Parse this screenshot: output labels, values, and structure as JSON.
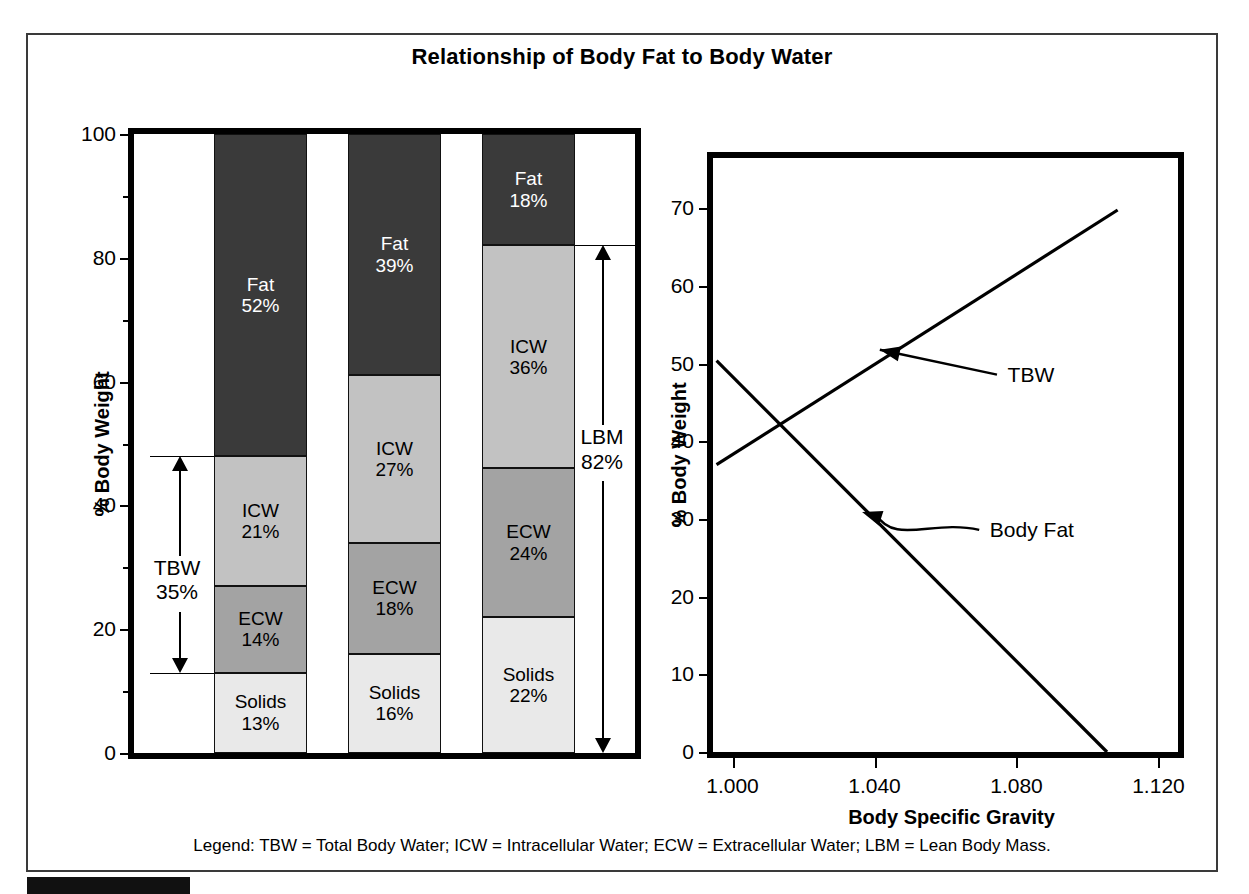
{
  "figure": {
    "title": "Relationship of Body Fat to Body Water",
    "legend": "Legend:  TBW = Total Body Water; ICW = Intracellular Water; ECW = Extracellular Water; LBM = Lean Body Mass."
  },
  "colors": {
    "fat": "#3a3a3a",
    "icw": "#c2c2c2",
    "ecw": "#a3a3a3",
    "solids": "#e9e9e9",
    "frame": "#000000",
    "text": "#000000",
    "background": "#ffffff"
  },
  "chart_data": [
    {
      "type": "bar",
      "id": "left-stacked-bar",
      "title": "",
      "xlabel": "",
      "ylabel": "% Body Weight",
      "ylim": [
        0,
        100
      ],
      "stacked": true,
      "grid": false,
      "legend_position": "in-segment-labels",
      "ytick_labels": [
        "0",
        "20",
        "40",
        "60",
        "80",
        "100"
      ],
      "ytick_values": [
        0,
        20,
        40,
        60,
        80,
        100
      ],
      "yminor_ticks": [
        10,
        30,
        50,
        70,
        90
      ],
      "categories": [
        "Subject 1",
        "Subject 2",
        "Subject 3"
      ],
      "series": [
        {
          "name": "Solids",
          "values": [
            13,
            16,
            22
          ]
        },
        {
          "name": "ECW",
          "values": [
            14,
            18,
            24
          ]
        },
        {
          "name": "ICW",
          "values": [
            21,
            27,
            36
          ]
        },
        {
          "name": "Fat",
          "values": [
            52,
            39,
            18
          ]
        }
      ],
      "bars": [
        {
          "index": 0,
          "segments": [
            {
              "label": "Fat",
              "value": 52,
              "value_text": "52%",
              "y0": 48,
              "y1": 100,
              "fill": "fat",
              "text_color": "#ffffff"
            },
            {
              "label": "ICW",
              "value": 21,
              "value_text": "21%",
              "y0": 27,
              "y1": 48,
              "fill": "icw",
              "text_color": "#000000"
            },
            {
              "label": "ECW",
              "value": 14,
              "value_text": "14%",
              "y0": 13,
              "y1": 27,
              "fill": "ecw",
              "text_color": "#000000"
            },
            {
              "label": "Solids",
              "value": 13,
              "value_text": "13%",
              "y0": 0,
              "y1": 13,
              "fill": "solids",
              "text_color": "#000000"
            }
          ]
        },
        {
          "index": 1,
          "segments": [
            {
              "label": "Fat",
              "value": 39,
              "value_text": "39%",
              "y0": 61,
              "y1": 100,
              "fill": "fat",
              "text_color": "#ffffff"
            },
            {
              "label": "ICW",
              "value": 27,
              "value_text": "27%",
              "y0": 34,
              "y1": 61,
              "fill": "icw",
              "text_color": "#000000"
            },
            {
              "label": "ECW",
              "value": 18,
              "value_text": "18%",
              "y0": 16,
              "y1": 34,
              "fill": "ecw",
              "text_color": "#000000"
            },
            {
              "label": "Solids",
              "value": 16,
              "value_text": "16%",
              "y0": 0,
              "y1": 16,
              "fill": "solids",
              "text_color": "#000000"
            }
          ]
        },
        {
          "index": 2,
          "segments": [
            {
              "label": "Fat",
              "value": 18,
              "value_text": "18%",
              "y0": 82,
              "y1": 100,
              "fill": "fat",
              "text_color": "#ffffff"
            },
            {
              "label": "ICW",
              "value": 36,
              "value_text": "36%",
              "y0": 46,
              "y1": 82,
              "fill": "icw",
              "text_color": "#000000"
            },
            {
              "label": "ECW",
              "value": 24,
              "value_text": "24%",
              "y0": 22,
              "y1": 46,
              "fill": "ecw",
              "text_color": "#000000"
            },
            {
              "label": "Solids",
              "value": 22,
              "value_text": "22%",
              "y0": 0,
              "y1": 22,
              "fill": "solids",
              "text_color": "#000000"
            }
          ]
        }
      ],
      "annotations": [
        {
          "id": "tbw-bracket",
          "label": "TBW",
          "value_text": "35%",
          "span_from": 13,
          "span_to": 48,
          "bar_index": 0,
          "side": "left"
        },
        {
          "id": "lbm-bracket",
          "label": "LBM",
          "value_text": "82%",
          "span_from": 0,
          "span_to": 82,
          "bar_index": 2,
          "side": "right"
        }
      ]
    },
    {
      "type": "line",
      "id": "right-line-chart",
      "title": "",
      "xlabel": "Body Specific Gravity",
      "ylabel": "% Body Weight",
      "xlim": [
        0.9945,
        1.1255
      ],
      "ylim": [
        0,
        76.5
      ],
      "grid": false,
      "legend_position": "inline-annotations",
      "xtick_values": [
        1.0,
        1.04,
        1.08,
        1.12
      ],
      "xtick_labels": [
        "1.000",
        "1.040",
        "1.080",
        "1.120"
      ],
      "ytick_values": [
        0,
        10,
        20,
        30,
        40,
        50,
        60,
        70
      ],
      "ytick_labels": [
        "0",
        "10",
        "20",
        "30",
        "40",
        "50",
        "60",
        "70"
      ],
      "series": [
        {
          "name": "TBW",
          "points": [
            {
              "x": 0.9955,
              "y": 37.0
            },
            {
              "x": 1.1085,
              "y": 69.8
            }
          ],
          "annotation": {
            "text": "TBW",
            "arrow": "straight"
          }
        },
        {
          "name": "Body Fat",
          "points": [
            {
              "x": 0.9955,
              "y": 50.4
            },
            {
              "x": 1.1055,
              "y": 0.0
            }
          ],
          "annotation": {
            "text": "Body Fat",
            "arrow": "curved"
          }
        }
      ]
    }
  ]
}
